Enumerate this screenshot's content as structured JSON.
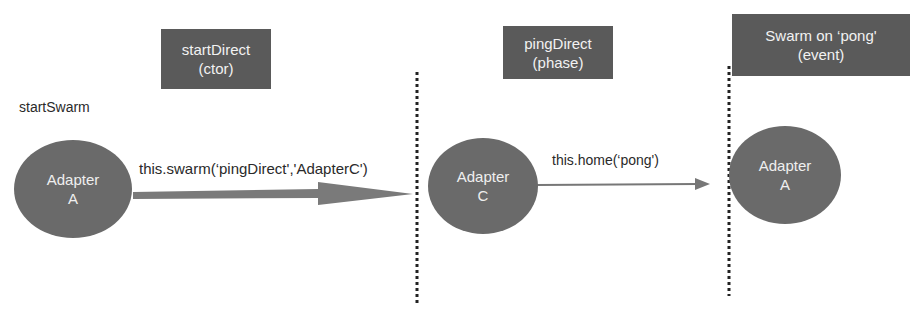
{
  "diagram": {
    "start_label": "startSwarm",
    "phase_boxes": [
      {
        "line1": "startDirect",
        "line2": "(ctor)"
      },
      {
        "line1": "pingDirect",
        "line2": "(phase)"
      },
      {
        "line1": "Swarm on ‘pong'",
        "line2": "(event)"
      }
    ],
    "nodes": [
      {
        "line1": "Adapter",
        "line2": "A"
      },
      {
        "line1": "Adapter",
        "line2": "C"
      },
      {
        "line1": "Adapter",
        "line2": "A"
      }
    ],
    "edges": [
      {
        "label": "this.swarm(‘pingDirect','AdapterC')",
        "from": "Adapter A",
        "to": "Adapter C"
      },
      {
        "label": "this.home(‘pong')",
        "from": "Adapter C",
        "to": "Adapter A"
      }
    ],
    "colors": {
      "box_fill": "#5a5a5a",
      "node_fill": "#6a6a6a",
      "arrow": "#777777",
      "divider": "#222222",
      "text_light": "#f2f2f2",
      "text_dark": "#2a2a2a"
    }
  }
}
